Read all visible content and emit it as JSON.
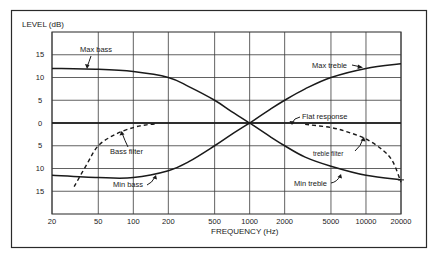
{
  "chart_data": {
    "type": "line",
    "title": "",
    "xlabel": "FREQUENCY (Hz)",
    "ylabel": "LEVEL (dB)",
    "xscale": "log",
    "xlim": [
      20,
      20000
    ],
    "ylim": [
      -20,
      20
    ],
    "grid": true,
    "legend": "none (curves labelled directly with annotations)",
    "x_ticks": [
      20,
      50,
      100,
      200,
      500,
      1000,
      2000,
      5000,
      10000,
      20000
    ],
    "x_tick_labels": [
      "20",
      "50",
      "100",
      "200",
      "500",
      "1000",
      "2000",
      "5000",
      "10000",
      "20000"
    ],
    "y_ticks": [
      15,
      10,
      5,
      0,
      -5,
      -10,
      -15
    ],
    "y_tick_labels": [
      "15",
      "10",
      "5",
      "0",
      "5",
      "10",
      "15"
    ],
    "series": [
      {
        "name": "Max bass",
        "style": "solid",
        "x": [
          20,
          50,
          100,
          200,
          300,
          500,
          700,
          1000
        ],
        "y": [
          12,
          11.8,
          11.3,
          10,
          8,
          5,
          2.5,
          0
        ]
      },
      {
        "name": "Min bass",
        "style": "solid",
        "x": [
          20,
          50,
          100,
          200,
          300,
          500,
          700,
          1000
        ],
        "y": [
          -11.5,
          -12,
          -12,
          -10.5,
          -8.5,
          -5,
          -2.5,
          0
        ]
      },
      {
        "name": "Max treble",
        "style": "solid",
        "x": [
          1000,
          1500,
          2000,
          3000,
          5000,
          10000,
          20000
        ],
        "y": [
          0,
          3,
          5,
          7.5,
          10,
          12,
          13
        ]
      },
      {
        "name": "Min treble",
        "style": "solid",
        "x": [
          1000,
          1500,
          2000,
          3000,
          5000,
          10000,
          20000
        ],
        "y": [
          0,
          -3,
          -5,
          -7.5,
          -9.5,
          -11.5,
          -12.5
        ]
      },
      {
        "name": "Flat response",
        "style": "solid",
        "x": [
          20,
          20000
        ],
        "y": [
          0,
          0
        ]
      },
      {
        "name": "Bass filter",
        "style": "dashed",
        "x": [
          31,
          40,
          50,
          70,
          100,
          130,
          160
        ],
        "y": [
          -14,
          -9,
          -5,
          -2.5,
          -1,
          -0.4,
          -0.2
        ]
      },
      {
        "name": "Treble filter",
        "style": "dashed",
        "x": [
          3000,
          5000,
          7000,
          10000,
          14000,
          17000,
          20000
        ],
        "y": [
          -0.3,
          -1,
          -2,
          -3.5,
          -6,
          -8.5,
          -13
        ]
      }
    ],
    "annotations": [
      "Max bass",
      "Min bass",
      "Bass filter",
      "Max treble",
      "Min treble",
      "Flat response",
      "treble filter"
    ]
  },
  "labels": {
    "y_axis_title": "LEVEL (dB)",
    "x_axis_title": "FREQUENCY (Hz)",
    "max_bass": "Max bass",
    "min_bass": "Min bass",
    "bass_filter": "Bass filter",
    "max_treble": "Max treble",
    "min_treble": "Min treble",
    "flat_response": "Flat response",
    "treble_filter": "treble filter"
  },
  "style": {
    "line_color": "#1a1a1a",
    "grid_color": "#3a3a3a",
    "frame_color": "#2a2a2a",
    "background": "#ffffff"
  }
}
